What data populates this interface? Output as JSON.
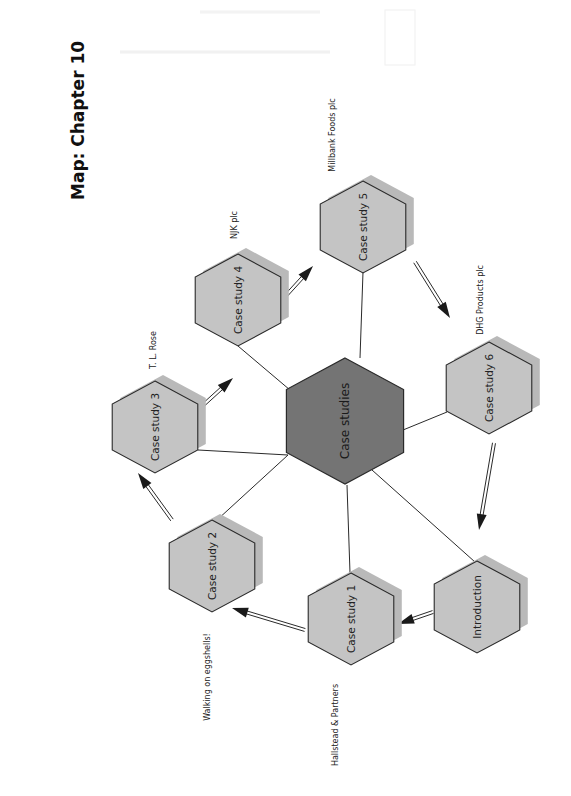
{
  "page": {
    "title": "Map: Chapter 10",
    "orientation": "rotated-90-ccw",
    "colors": {
      "background": "#ffffff",
      "hex_fill": "#c4c4c4",
      "hex_shadow": "#b9b9b9",
      "center_fill": "#747474",
      "stroke": "#2a2a2a"
    }
  },
  "diagram": {
    "center": {
      "id": "center",
      "label": "Case studies",
      "x": 345,
      "y": 421,
      "r": 63
    },
    "nodes": [
      {
        "id": "intro",
        "label": "Introduction",
        "x": 477,
        "y": 607,
        "r": 46,
        "company": ""
      },
      {
        "id": "cs1",
        "label": "Case study  1",
        "x": 351,
        "y": 619,
        "r": 46,
        "company": "Hallstead & Partners"
      },
      {
        "id": "cs2",
        "label": "Case study  2",
        "x": 212,
        "y": 566,
        "r": 46,
        "company": "Walking on eggshells!"
      },
      {
        "id": "cs3",
        "label": "Case study  3",
        "x": 155,
        "y": 427,
        "r": 46,
        "company": "T. L. Rose"
      },
      {
        "id": "cs4",
        "label": "Case study  4",
        "x": 238,
        "y": 300,
        "r": 46,
        "company": "NJK plc"
      },
      {
        "id": "cs5",
        "label": "Case study  5",
        "x": 363,
        "y": 227,
        "r": 46,
        "company": "Millbank Foods plc"
      },
      {
        "id": "cs6",
        "label": "Case study  6",
        "x": 489,
        "y": 388,
        "r": 46,
        "company": "DHG Products plc"
      }
    ],
    "sequence": [
      "Introduction",
      "Case study 1",
      "Case study 2",
      "Case study 3",
      "Case study 4",
      "Case study 5",
      "Case study 6",
      "Introduction"
    ],
    "company_labels": [
      {
        "text": "Hallstead & Partners",
        "x": 335,
        "y": 725
      },
      {
        "text": "Walking on eggshells!",
        "x": 207,
        "y": 677
      },
      {
        "text": "T. L. Rose",
        "x": 153,
        "y": 350
      },
      {
        "text": "NJK plc",
        "x": 234,
        "y": 225
      },
      {
        "text": "Millbank Foods plc",
        "x": 332,
        "y": 135
      },
      {
        "text": "DHG Products plc",
        "x": 480,
        "y": 300
      }
    ]
  }
}
